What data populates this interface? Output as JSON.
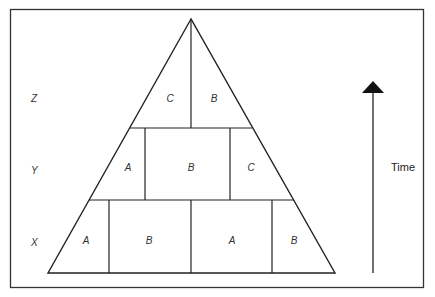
{
  "diagram": {
    "levels": [
      {
        "name": "Z",
        "cells": [
          "C",
          "B"
        ]
      },
      {
        "name": "Y",
        "cells": [
          "A",
          "B",
          "C"
        ]
      },
      {
        "name": "X",
        "cells": [
          "A",
          "B",
          "A",
          "B"
        ]
      }
    ],
    "arrow_label": "Time",
    "colors": {
      "line": "#222222",
      "text": "#333333",
      "background": "#ffffff"
    }
  }
}
